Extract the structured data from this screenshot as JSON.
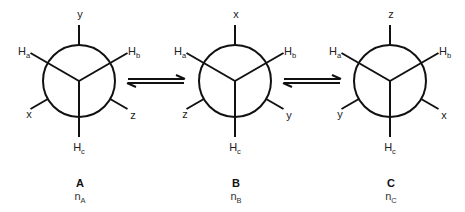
{
  "diagram": {
    "type": "newman-projection-equilibrium",
    "conformers": [
      {
        "id": "A",
        "title": "A",
        "population": {
          "base": "n",
          "subscript": "A"
        },
        "center": [
          79,
          81
        ],
        "front": {
          "top_left": {
            "base": "H",
            "sub": "a"
          },
          "top_right": {
            "base": "H",
            "sub": "b"
          },
          "bottom": {
            "base": "H",
            "sub": "c"
          }
        },
        "back": {
          "top": "y",
          "bottom_left": "x",
          "bottom_right": "z"
        }
      },
      {
        "id": "B",
        "title": "B",
        "population": {
          "base": "n",
          "subscript": "B"
        },
        "center": [
          235,
          81
        ],
        "front": {
          "top_left": {
            "base": "H",
            "sub": "a"
          },
          "top_right": {
            "base": "H",
            "sub": "b"
          },
          "bottom": {
            "base": "H",
            "sub": "c"
          }
        },
        "back": {
          "top": "x",
          "bottom_left": "z",
          "bottom_right": "y"
        }
      },
      {
        "id": "C",
        "title": "C",
        "population": {
          "base": "n",
          "subscript": "C"
        },
        "center": [
          390,
          81
        ],
        "front": {
          "top_left": {
            "base": "H",
            "sub": "a"
          },
          "top_right": {
            "base": "H",
            "sub": "b"
          },
          "bottom": {
            "base": "H",
            "sub": "c"
          }
        },
        "back": {
          "top": "z",
          "bottom_left": "y",
          "bottom_right": "x"
        }
      }
    ],
    "equilibria": [
      {
        "from": "A",
        "to": "B",
        "symbol": "equilibrium-arrows"
      },
      {
        "from": "B",
        "to": "C",
        "symbol": "equilibrium-arrows"
      }
    ],
    "colors": {
      "stroke": "#111111",
      "background": "#ffffff"
    }
  }
}
